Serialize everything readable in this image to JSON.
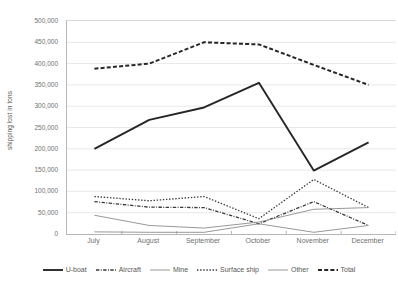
{
  "chart_data": {
    "type": "line",
    "title": "",
    "xlabel": "",
    "ylabel": "shipping lost in tons",
    "categories": [
      "July",
      "August",
      "September",
      "October",
      "November",
      "December"
    ],
    "ylim": [
      0,
      500000
    ],
    "ytick_step": 50000,
    "ytick_labels": [
      "500,000",
      "450,000",
      "400,000",
      "350,000",
      "300,000",
      "250,000",
      "200,000",
      "150,000",
      "100,000",
      "50,000",
      "0"
    ],
    "ytick_values": [
      500000,
      450000,
      400000,
      350000,
      300000,
      250000,
      200000,
      150000,
      100000,
      50000,
      0
    ],
    "grid": true,
    "grid_axis": "y",
    "legend_position": "bottom",
    "series": [
      {
        "name": "U-boat",
        "values": [
          200000,
          268000,
          297000,
          355000,
          149000,
          215000
        ],
        "style": "solid",
        "width": 1.9,
        "color": "#262626"
      },
      {
        "name": "Aircraft",
        "values": [
          76000,
          63000,
          62000,
          24000,
          76000,
          20000
        ],
        "style": "dashdot",
        "width": 1.3,
        "color": "#3a3a3a"
      },
      {
        "name": "Mine",
        "values": [
          5000,
          4000,
          4000,
          24000,
          4000,
          20000
        ],
        "style": "solid",
        "width": 0.9,
        "color": "#8c8c8c"
      },
      {
        "name": "Surface ship",
        "values": [
          88000,
          78000,
          88000,
          36000,
          128000,
          62000
        ],
        "style": "dotted",
        "width": 1.3,
        "color": "#3a3a3a"
      },
      {
        "name": "Other",
        "values": [
          44000,
          20000,
          14000,
          28000,
          58000,
          62000
        ],
        "style": "solid",
        "width": 0.9,
        "color": "#8c8c8c"
      },
      {
        "name": "Total",
        "values": [
          388000,
          400000,
          450000,
          445000,
          397000,
          350000
        ],
        "style": "dashed",
        "width": 2.0,
        "color": "#262626"
      }
    ]
  },
  "axes": {
    "y_title": "shipping lost in tons"
  },
  "colors": {
    "plot_background": "#ffffff",
    "gridline": "#e8e8e8",
    "axis_line": "#b6b6b6",
    "tick_text": "#707070",
    "legend_text": "#595959"
  }
}
